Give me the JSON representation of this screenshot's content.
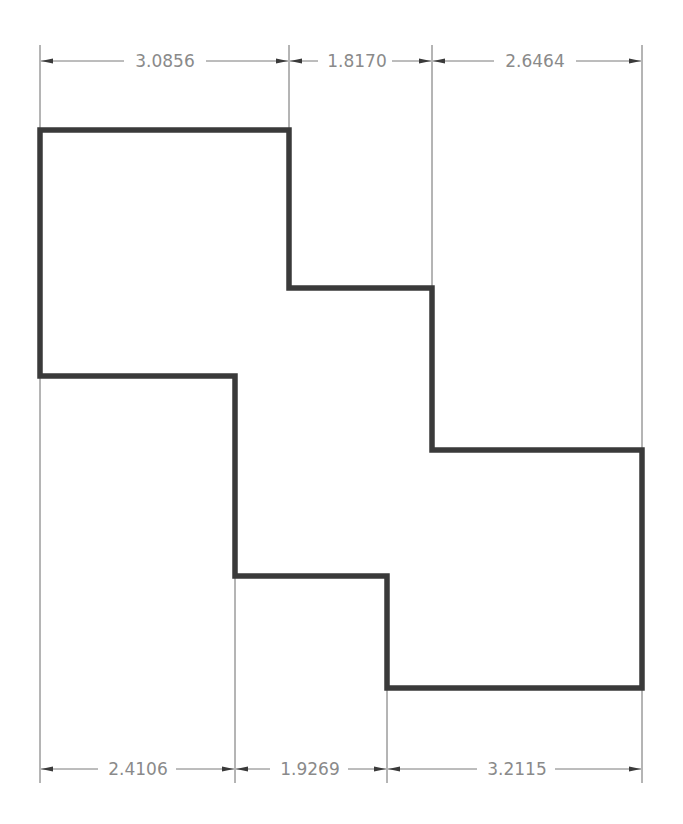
{
  "drawing": {
    "type": "stepped polygon with linear dimensions",
    "colors": {
      "outline": "#3a3a3a",
      "dimension_text": "#8a8a8a",
      "dimension_lines": "#7a7a7a",
      "background": "#ffffff"
    },
    "top_dimensions": [
      {
        "label": "3.0856",
        "x1": 40,
        "x2": 289
      },
      {
        "label": "1.8170",
        "x1": 289,
        "x2": 432
      },
      {
        "label": "2.6464",
        "x1": 432,
        "x2": 642
      }
    ],
    "bottom_dimensions": [
      {
        "label": "2.4106",
        "x1": 40,
        "x2": 235
      },
      {
        "label": "1.9269",
        "x1": 235,
        "x2": 387
      },
      {
        "label": "3.2115",
        "x1": 387,
        "x2": 642
      }
    ],
    "outline_vertices": [
      [
        40,
        130
      ],
      [
        289,
        130
      ],
      [
        289,
        288
      ],
      [
        432,
        288
      ],
      [
        432,
        450
      ],
      [
        642,
        450
      ],
      [
        642,
        688
      ],
      [
        387,
        688
      ],
      [
        387,
        576
      ],
      [
        235,
        576
      ],
      [
        235,
        376
      ],
      [
        40,
        376
      ]
    ]
  }
}
